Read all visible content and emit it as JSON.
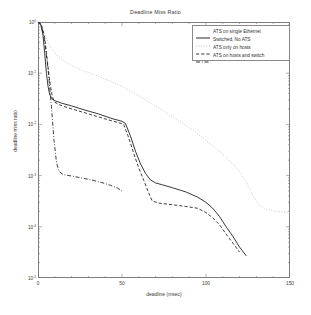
{
  "chart_data": {
    "type": "line",
    "title": "Deadline Miss Ratio",
    "xlabel": "deadline (msec)",
    "ylabel": "deadline miss ratio",
    "xlim": [
      0,
      150
    ],
    "ylim": [
      1e-05,
      1
    ],
    "yscale": "log",
    "xscale": "linear",
    "grid": false,
    "legend_position": "top-right",
    "xticks": [
      "0",
      "50",
      "100",
      "150"
    ],
    "xtick_values": [
      0,
      50,
      100,
      150
    ],
    "ytick_labels": [
      "10",
      "10",
      "10",
      "10",
      "10",
      "10"
    ],
    "ytick_exponents": [
      "0",
      "-1",
      "-2",
      "-3",
      "-4",
      "-5"
    ],
    "ytick_values": [
      1,
      0.1,
      0.01,
      0.001,
      0.0001,
      1e-05
    ],
    "series": [
      {
        "name": "ATS on single Ethernet",
        "style": "solid",
        "color": "#141414",
        "points": [
          [
            0,
            1.0
          ],
          [
            1.5,
            0.92
          ],
          [
            3,
            0.55
          ],
          [
            4,
            0.24
          ],
          [
            5,
            0.1
          ],
          [
            6,
            0.055
          ],
          [
            7,
            0.038
          ],
          [
            8.5,
            0.031
          ],
          [
            10,
            0.029
          ],
          [
            14,
            0.026
          ],
          [
            20,
            0.023
          ],
          [
            28,
            0.019
          ],
          [
            36,
            0.016
          ],
          [
            44,
            0.013
          ],
          [
            50,
            0.0115
          ],
          [
            52,
            0.0105
          ],
          [
            55,
            0.006
          ],
          [
            58,
            0.003
          ],
          [
            61,
            0.0017
          ],
          [
            64,
            0.0011
          ],
          [
            67,
            0.00082
          ],
          [
            70,
            0.00072
          ],
          [
            74,
            0.00066
          ],
          [
            80,
            0.00058
          ],
          [
            88,
            0.00048
          ],
          [
            95,
            0.00038
          ],
          [
            100,
            0.0003
          ],
          [
            104,
            0.00023
          ],
          [
            108,
            0.00016
          ],
          [
            112,
            0.0001
          ],
          [
            116,
            6.5e-05
          ],
          [
            120,
            4e-05
          ],
          [
            124,
            2.7e-05
          ]
        ]
      },
      {
        "name": "Switched, No ATS",
        "style": "dotted",
        "color": "#b4b4b4",
        "points": [
          [
            0,
            1.0
          ],
          [
            2,
            0.88
          ],
          [
            4,
            0.6
          ],
          [
            6,
            0.4
          ],
          [
            8,
            0.3
          ],
          [
            11,
            0.23
          ],
          [
            15,
            0.18
          ],
          [
            20,
            0.14
          ],
          [
            26,
            0.115
          ],
          [
            32,
            0.098
          ],
          [
            38,
            0.082
          ],
          [
            44,
            0.068
          ],
          [
            50,
            0.055
          ],
          [
            56,
            0.043
          ],
          [
            62,
            0.033
          ],
          [
            68,
            0.025
          ],
          [
            74,
            0.019
          ],
          [
            80,
            0.014
          ],
          [
            86,
            0.0105
          ],
          [
            92,
            0.0078
          ],
          [
            98,
            0.0055
          ],
          [
            104,
            0.0038
          ],
          [
            110,
            0.0026
          ],
          [
            116,
            0.0017
          ],
          [
            120,
            0.0012
          ],
          [
            124,
            0.00075
          ],
          [
            128,
            0.0004
          ],
          [
            132,
            0.00026
          ],
          [
            136,
            0.00022
          ],
          [
            142,
            0.0002
          ],
          [
            150,
            0.00019
          ]
        ]
      },
      {
        "name": "ATS only on hosts",
        "style": "dashed",
        "color": "#1e1e1e",
        "points": [
          [
            0,
            1.0
          ],
          [
            2,
            0.9
          ],
          [
            4,
            0.5
          ],
          [
            5.5,
            0.18
          ],
          [
            7,
            0.068
          ],
          [
            8.5,
            0.035
          ],
          [
            10,
            0.027
          ],
          [
            13,
            0.024
          ],
          [
            18,
            0.021
          ],
          [
            25,
            0.018
          ],
          [
            33,
            0.015
          ],
          [
            41,
            0.0125
          ],
          [
            48,
            0.0108
          ],
          [
            51,
            0.01
          ],
          [
            54,
            0.0055
          ],
          [
            57,
            0.0027
          ],
          [
            60,
            0.0014
          ],
          [
            63,
            0.0008
          ],
          [
            66,
            0.00045
          ],
          [
            68,
            0.00032
          ],
          [
            72,
            0.00029
          ],
          [
            80,
            0.00027
          ],
          [
            88,
            0.00025
          ],
          [
            95,
            0.00023
          ],
          [
            100,
            0.00019
          ],
          [
            104,
            0.00015
          ],
          [
            108,
            0.00011
          ],
          [
            112,
            7.2e-05
          ],
          [
            116,
            4.8e-05
          ],
          [
            120,
            3.2e-05
          ]
        ]
      },
      {
        "name": "ATS on hosts and switch",
        "style": "dashdot",
        "color": "#1e1e1e",
        "points": [
          [
            0,
            1.0
          ],
          [
            2,
            0.88
          ],
          [
            4,
            0.42
          ],
          [
            6,
            0.12
          ],
          [
            8,
            0.022
          ],
          [
            9.5,
            0.005
          ],
          [
            11,
            0.0018
          ],
          [
            12.5,
            0.0012
          ],
          [
            15,
            0.00105
          ],
          [
            20,
            0.00098
          ],
          [
            26,
            0.0009
          ],
          [
            32,
            0.00082
          ],
          [
            38,
            0.00073
          ],
          [
            43,
            0.00065
          ],
          [
            47,
            0.00058
          ],
          [
            50,
            0.0005
          ]
        ]
      }
    ]
  },
  "legend": {
    "entries": [
      {
        "label": "ATS on single Ethernet",
        "style": "solid"
      },
      {
        "label": "Switched, No ATS",
        "style": "dotted"
      },
      {
        "label": "ATS only on hosts",
        "style": "dashed"
      },
      {
        "label": "ATS on hosts and switch",
        "style": "dashdot"
      }
    ]
  }
}
